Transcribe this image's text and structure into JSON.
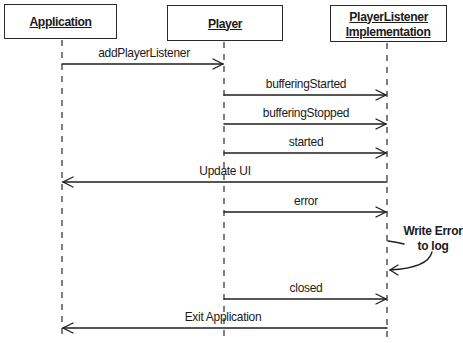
{
  "diagram": {
    "type": "sequence",
    "participants": [
      {
        "id": "app",
        "label_lines": [
          "Application"
        ]
      },
      {
        "id": "player",
        "label_lines": [
          "Player"
        ]
      },
      {
        "id": "listener",
        "label_lines": [
          "PlayerListener",
          "Implementation"
        ]
      }
    ],
    "messages": [
      {
        "from": "app",
        "to": "player",
        "label": "addPlayerListener"
      },
      {
        "from": "player",
        "to": "listener",
        "label": "bufferingStarted"
      },
      {
        "from": "player",
        "to": "listener",
        "label": "bufferingStopped"
      },
      {
        "from": "player",
        "to": "listener",
        "label": "started"
      },
      {
        "from": "listener",
        "to": "app",
        "label": "Update UI"
      },
      {
        "from": "player",
        "to": "listener",
        "label": "error"
      },
      {
        "from": "listener",
        "to": "listener",
        "label_lines": [
          "Write Error",
          "to log"
        ]
      },
      {
        "from": "player",
        "to": "listener",
        "label": "closed"
      },
      {
        "from": "listener",
        "to": "app",
        "label": "Exit Application"
      }
    ]
  }
}
